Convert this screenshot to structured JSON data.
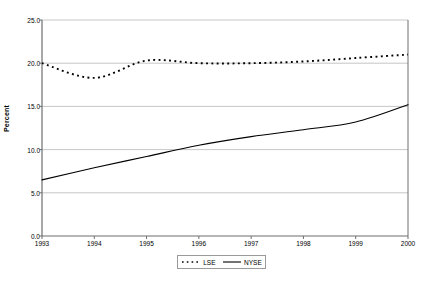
{
  "chart_data": {
    "type": "line",
    "title": "",
    "xlabel": "",
    "ylabel": "Percent",
    "x": [
      1993,
      1994,
      1995,
      1996,
      1997,
      1998,
      1999,
      2000
    ],
    "categories": [
      "1993",
      "1994",
      "1995",
      "1996",
      "1997",
      "1998",
      "1999",
      "2000"
    ],
    "xlim": [
      1993,
      2000
    ],
    "ylim": [
      0.0,
      25.0
    ],
    "yticks": [
      0.0,
      5.0,
      10.0,
      15.0,
      20.0,
      25.0
    ],
    "ytick_labels": [
      "0.0",
      "5.0",
      "10.0",
      "15.0",
      "20.0",
      "25.0"
    ],
    "xtick_labels": [
      "1993",
      "1994",
      "1995",
      "1996",
      "1997",
      "1998",
      "1999",
      "2000"
    ],
    "grid": "horizontal",
    "legend_position": "bottom-center",
    "series": [
      {
        "name": "LSE",
        "style": "dotted",
        "color": "#000000",
        "values": [
          20.0,
          18.3,
          20.3,
          20.0,
          20.0,
          20.2,
          20.6,
          21.0
        ]
      },
      {
        "name": "NYSE",
        "style": "solid",
        "color": "#000000",
        "values": [
          6.5,
          7.9,
          9.2,
          10.5,
          11.5,
          12.3,
          13.2,
          15.2
        ]
      }
    ]
  },
  "axis": {
    "y_title": "Percent",
    "y_labels": [
      "25.0",
      "20.0",
      "15.0",
      "10.0",
      "5.0",
      "0.0"
    ],
    "x_labels": [
      "1993",
      "1994",
      "1995",
      "1996",
      "1997",
      "1998",
      "1999",
      "2000"
    ]
  },
  "legend": {
    "entries": [
      {
        "label": "LSE",
        "style": "dotted"
      },
      {
        "label": "NYSE",
        "style": "solid"
      }
    ]
  },
  "colors": {
    "line": "#000000",
    "grid": "#b8b8b8",
    "frame": "#6e6e6e",
    "background": "#ffffff"
  }
}
